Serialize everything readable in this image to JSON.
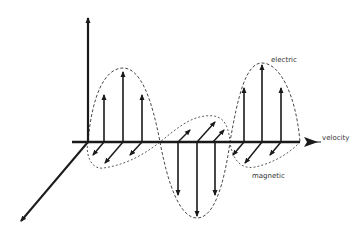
{
  "diagram": {
    "labels": {
      "electric": "electric",
      "magnetic": "magnetic",
      "velocity": "velocity"
    },
    "axes": [
      "vertical (electric field axis)",
      "horizontal (propagation axis)",
      "diagonal (magnetic field axis)"
    ],
    "components": [
      {
        "name": "electric",
        "direction": "vertical",
        "arrows": [
          {
            "x": 104,
            "tip_y": 95,
            "sign": "up"
          },
          {
            "x": 123,
            "tip_y": 72,
            "sign": "up"
          },
          {
            "x": 142,
            "tip_y": 95,
            "sign": "up"
          },
          {
            "x": 178,
            "tip_y": 195,
            "sign": "down"
          },
          {
            "x": 197,
            "tip_y": 216,
            "sign": "down"
          },
          {
            "x": 215,
            "tip_y": 195,
            "sign": "down"
          },
          {
            "x": 244,
            "tip_y": 88,
            "sign": "up"
          },
          {
            "x": 262,
            "tip_y": 65,
            "sign": "up"
          },
          {
            "x": 281,
            "tip_y": 88,
            "sign": "up"
          }
        ]
      },
      {
        "name": "magnetic",
        "direction": "diagonal",
        "arrows": [
          {
            "x": 104,
            "sign": "toward-viewer",
            "length": "short"
          },
          {
            "x": 123,
            "sign": "toward-viewer",
            "length": "long"
          },
          {
            "x": 142,
            "sign": "toward-viewer",
            "length": "short"
          },
          {
            "x": 178,
            "sign": "away",
            "length": "short"
          },
          {
            "x": 197,
            "sign": "away",
            "length": "long"
          },
          {
            "x": 215,
            "sign": "away",
            "length": "short"
          },
          {
            "x": 244,
            "sign": "toward-viewer",
            "length": "short"
          },
          {
            "x": 262,
            "sign": "toward-viewer",
            "length": "long"
          },
          {
            "x": 281,
            "sign": "toward-viewer",
            "length": "short"
          }
        ]
      }
    ],
    "colors": {
      "line": "#1a1a1a",
      "envelope": "#333333",
      "text": "#333333",
      "background": "#ffffff"
    }
  }
}
